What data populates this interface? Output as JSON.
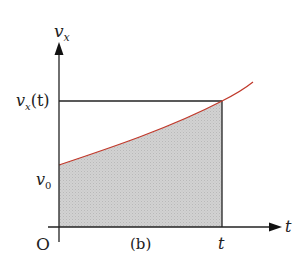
{
  "figure": {
    "panel_label": "(b)",
    "origin_label": "O",
    "y_axis": {
      "symbol": "v",
      "subscript": "x"
    },
    "x_axis": {
      "symbol": "t"
    },
    "tick_labels": {
      "vx_t": {
        "symbol": "v",
        "subscript": "x",
        "arg": "(t)"
      },
      "v0": {
        "symbol": "v",
        "subscript": "0"
      },
      "t": "t"
    },
    "colors": {
      "curve": "#c0392b",
      "shaded_area": "#cfcfcf",
      "axes": "#222222"
    }
  }
}
